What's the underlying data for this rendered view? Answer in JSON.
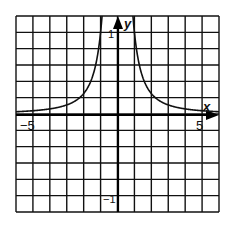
{
  "chart_data": {
    "type": "line",
    "title": "",
    "function": "y = 1/x^2",
    "xlabel": "x",
    "ylabel": "y",
    "xlim": [
      -6,
      6
    ],
    "ylim": [
      -1.2,
      1.2
    ],
    "x_grid_step": 1,
    "y_grid_step": 0.2,
    "grid": true,
    "legend": "none",
    "x_tick_labels": [
      {
        "value": -5,
        "label": "−5"
      },
      {
        "value": 5,
        "label": "5"
      }
    ],
    "y_tick_labels": [
      {
        "value": 1,
        "label": "1"
      },
      {
        "value": -1,
        "label": "−1"
      }
    ],
    "series": [
      {
        "name": "left branch",
        "x": [
          -6,
          -5,
          -4,
          -3,
          -2.5,
          -2,
          -1.5,
          -1.25,
          -1.1,
          -1,
          -0.92
        ],
        "y": [
          0.028,
          0.04,
          0.063,
          0.111,
          0.16,
          0.25,
          0.444,
          0.64,
          0.826,
          1.0,
          1.18
        ]
      },
      {
        "name": "right branch",
        "x": [
          0.92,
          1,
          1.1,
          1.25,
          1.5,
          2,
          2.5,
          3,
          4,
          5,
          6
        ],
        "y": [
          1.18,
          1.0,
          0.826,
          0.64,
          0.444,
          0.25,
          0.16,
          0.111,
          0.063,
          0.04,
          0.028
        ]
      }
    ]
  },
  "labels": {
    "x_axis": "x",
    "y_axis": "y",
    "x_neg5": "−5",
    "x_pos5": "5",
    "y_pos1": "1",
    "y_neg1": "−1"
  },
  "colors": {
    "grid": "#111111",
    "axis": "#000000",
    "curve": "#111111",
    "background": "#ffffff"
  }
}
